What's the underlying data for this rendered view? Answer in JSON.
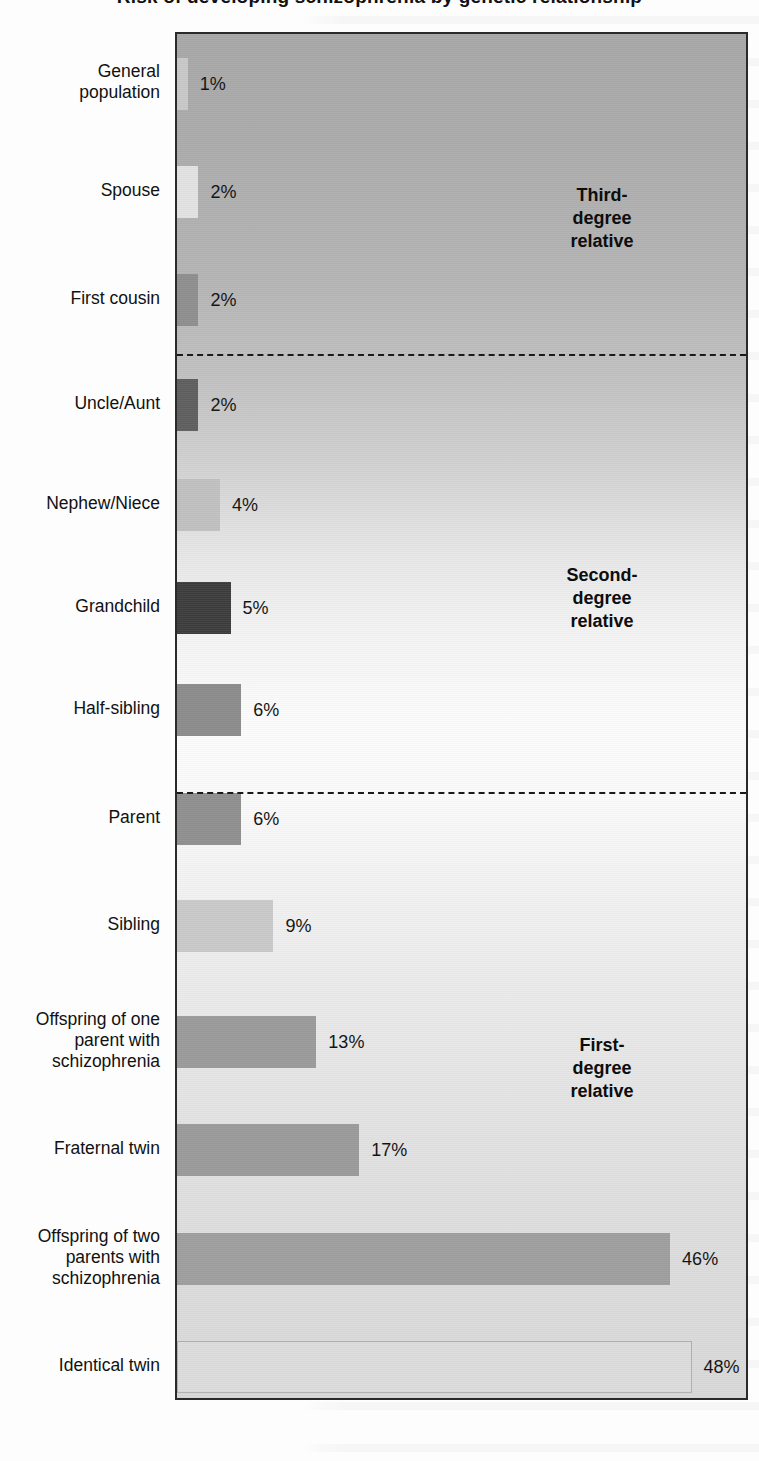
{
  "figure": {
    "title": "Risk of developing schizophrenia by genetic relationship",
    "value_suffix": "%"
  },
  "chart_data": {
    "type": "bar",
    "orientation": "horizontal",
    "title": "Risk of developing schizophrenia by genetic relationship",
    "xlabel": "",
    "ylabel": "",
    "xlim": [
      0,
      50
    ],
    "grid": false,
    "legend": "none",
    "categories": [
      "General\npopulation",
      "Spouse",
      "First cousin",
      "Uncle/Aunt",
      "Nephew/Niece",
      "Grandchild",
      "Half-sibling",
      "Parent",
      "Sibling",
      "Offspring of one\nparent with\nschizophrenia",
      "Fraternal twin",
      "Offspring of two\nparents with\nschizophrenia",
      "Identical twin"
    ],
    "values": [
      1,
      2,
      2,
      2,
      4,
      5,
      6,
      6,
      9,
      13,
      17,
      46,
      48
    ],
    "data_labels": [
      "1%",
      "2%",
      "2%",
      "2%",
      "4%",
      "5%",
      "6%",
      "6%",
      "9%",
      "13%",
      "17%",
      "46%",
      "48%"
    ],
    "bar_colors": [
      "#c8c8c8",
      "#e2e2e2",
      "#8e8e8e",
      "#5e5e5e",
      "#c0c0c0",
      "#3c3c3c",
      "#8b8b8b",
      "#8f8f8f",
      "#c9c9c9",
      "#9a9a9a",
      "#9a9a9a",
      "#9e9e9e",
      "#dcdcdc"
    ],
    "annotations": [
      {
        "label": "Third-\ndegree\nrelative",
        "group": "third-degree"
      },
      {
        "label": "Second-\ndegree\nrelative",
        "group": "second-degree"
      },
      {
        "label": "First-\ndegree\nrelative",
        "group": "first-degree"
      }
    ],
    "separators": [
      "after First cousin",
      "after Half-sibling"
    ]
  }
}
